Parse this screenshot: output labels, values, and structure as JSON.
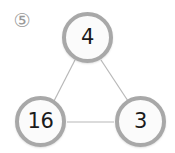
{
  "figure": {
    "index_label": "⑤",
    "background_color": "#ffffff",
    "node_fill_color": "#fbfbfb",
    "node_border_color": "#a8a8a8",
    "node_text_color": "#1b1b1b",
    "edge_color": "#b8b8b8",
    "label_color": "#9a9a9a"
  },
  "graph": {
    "nodes": [
      {
        "id": "top",
        "label": "4",
        "cx": 88,
        "cy": 38,
        "r": 25
      },
      {
        "id": "left",
        "label": "16",
        "cx": 41,
        "cy": 122,
        "r": 25
      },
      {
        "id": "right",
        "label": "3",
        "cx": 141,
        "cy": 122,
        "r": 25
      }
    ],
    "edges": [
      {
        "from": "top",
        "to": "left",
        "x1": 75,
        "y1": 60,
        "x2": 54,
        "y2": 101
      },
      {
        "from": "top",
        "to": "right",
        "x1": 101,
        "y1": 60,
        "x2": 128,
        "y2": 101
      },
      {
        "from": "left",
        "to": "right",
        "x1": 67,
        "y1": 122,
        "x2": 114,
        "y2": 122
      }
    ]
  }
}
